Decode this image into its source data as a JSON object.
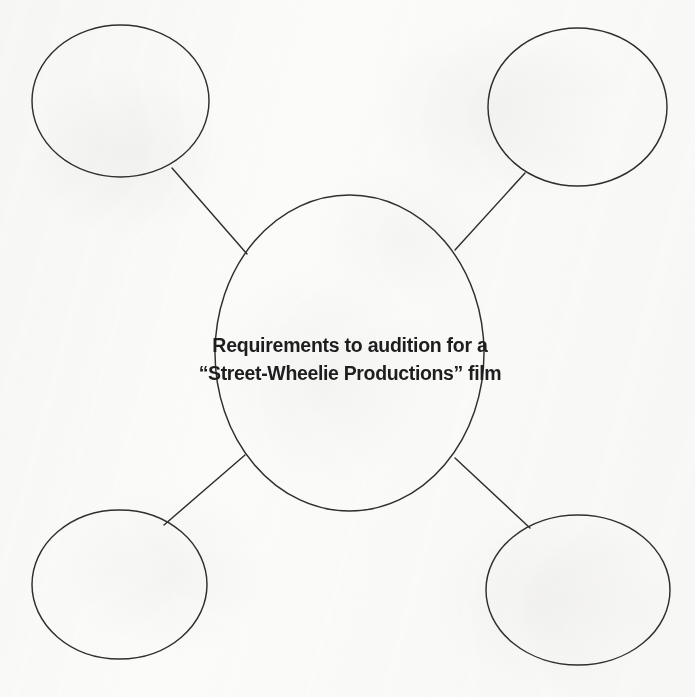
{
  "worksheet": {
    "type": "concept-web-diagram",
    "background_color": "#fbfbfa",
    "ink_color": "#2f2f2f",
    "center_bubble": {
      "label_line_1": "Requirements to audition for a",
      "label_line_2": "“Street-Wheelie Productions” film",
      "cx": 349.5,
      "cy": 353,
      "rx": 134.5,
      "ry": 158
    },
    "satellite_bubbles": [
      {
        "name": "top-left",
        "text": "",
        "cx": 120.5,
        "cy": 101,
        "rx": 88.5,
        "ry": 76
      },
      {
        "name": "top-right",
        "text": "",
        "cx": 577.5,
        "cy": 107,
        "rx": 89.5,
        "ry": 79
      },
      {
        "name": "bottom-left",
        "text": "",
        "cx": 119.5,
        "cy": 584.5,
        "rx": 87.5,
        "ry": 74.5
      },
      {
        "name": "bottom-right",
        "text": "",
        "cx": 578,
        "cy": 590,
        "rx": 92,
        "ry": 75
      }
    ],
    "connectors": [
      {
        "name": "connector-top-left",
        "x1": 172,
        "y1": 168,
        "x2": 247,
        "y2": 254
      },
      {
        "name": "connector-top-right",
        "x1": 525,
        "y1": 173,
        "x2": 455,
        "y2": 250
      },
      {
        "name": "connector-bottom-left",
        "x1": 245,
        "y1": 455,
        "x2": 164,
        "y2": 525
      },
      {
        "name": "connector-bottom-right",
        "x1": 455,
        "y1": 458,
        "x2": 530,
        "y2": 528
      }
    ]
  }
}
